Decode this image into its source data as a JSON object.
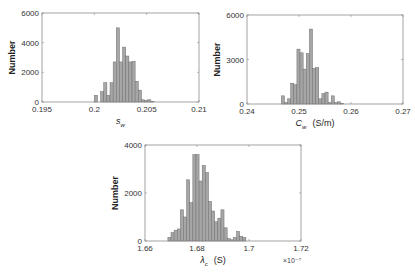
{
  "colors": {
    "bar_fill": "#a6a6a6",
    "bar_edge": "#6e6e6e",
    "axis": "#8c8c8c",
    "text": "#333333"
  },
  "chart_data": [
    {
      "type": "bar",
      "title": "",
      "xlabel": "s_w",
      "xlabel_main": "s",
      "xlabel_sub": "w",
      "xlabel_unit": "",
      "ylabel": "Number",
      "xlim": [
        0.195,
        0.21
      ],
      "ylim": [
        0,
        6000
      ],
      "xticks": [
        "0.195",
        "0.2",
        "0.205",
        "0.21"
      ],
      "xtick_values": [
        0.195,
        0.2,
        0.205,
        0.21
      ],
      "yticks": [
        "0",
        "2000",
        "4000",
        "6000"
      ],
      "ytick_values": [
        0,
        2000,
        4000,
        6000
      ],
      "bin_start": 0.2,
      "bin_width": 0.0003,
      "values": [
        450,
        0,
        700,
        1300,
        450,
        1300,
        2700,
        5000,
        2700,
        3700,
        3100,
        2700,
        2750,
        1400,
        800,
        150,
        100,
        150,
        50
      ],
      "multiplier": "",
      "grid": false,
      "box": {
        "left": 42,
        "top": 13,
        "right": 199,
        "bottom": 102
      }
    },
    {
      "type": "bar",
      "title": "",
      "xlabel": "C_w (S/m)",
      "xlabel_main": "C",
      "xlabel_sub": "w",
      "xlabel_unit": "(S/m)",
      "ylabel": "Number",
      "xlim": [
        0.24,
        0.27
      ],
      "ylim": [
        0,
        6000
      ],
      "xticks": [
        "0.24",
        "0.25",
        "0.26",
        "0.27"
      ],
      "xtick_values": [
        0.24,
        0.25,
        0.26,
        0.27
      ],
      "yticks": [
        "0",
        "3000",
        "6000"
      ],
      "ytick_values": [
        0,
        3000,
        6000
      ],
      "bin_start": 0.2466,
      "bin_width": 0.0006,
      "values": [
        550,
        100,
        350,
        1400,
        1300,
        3700,
        3450,
        2350,
        3400,
        5050,
        2400,
        2450,
        350,
        700,
        800,
        100,
        550,
        100,
        150,
        50
      ],
      "multiplier": "",
      "grid": false,
      "box": {
        "left": 247,
        "top": 15,
        "right": 403,
        "bottom": 104
      }
    },
    {
      "type": "bar",
      "title": "",
      "xlabel": "λ_c (S)",
      "xlabel_main": "λ",
      "xlabel_sub": "c",
      "xlabel_unit": "(S)",
      "ylabel": "Number",
      "xlim": [
        1.66,
        1.72
      ],
      "ylim": [
        0,
        4000
      ],
      "xticks": [
        "1.66",
        "1.68",
        "1.7",
        "1.72"
      ],
      "xtick_values": [
        1.66,
        1.68,
        1.7,
        1.72
      ],
      "yticks": [
        "0",
        "2000",
        "4000"
      ],
      "ytick_values": [
        0,
        2000,
        4000
      ],
      "bin_start": 1.6688,
      "bin_width": 0.0012,
      "values": [
        150,
        350,
        450,
        500,
        1300,
        1000,
        2550,
        1600,
        3600,
        3600,
        2500,
        3150,
        2850,
        1650,
        1250,
        800,
        950,
        1300,
        550,
        100,
        50,
        150,
        400,
        200,
        150
      ],
      "multiplier": "×10⁻⁷",
      "grid": false,
      "box": {
        "left": 145,
        "top": 145,
        "right": 301,
        "bottom": 241
      }
    }
  ]
}
